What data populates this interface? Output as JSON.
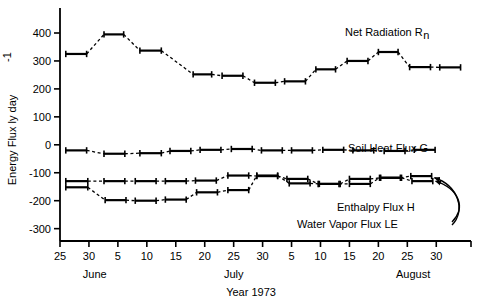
{
  "chart_data": {
    "type": "line",
    "title": "",
    "xlabel": "Year 1973",
    "ylabel": "Energy Flux   ly  day",
    "ylabel_exponent": "-1",
    "ylim": [
      -300,
      450
    ],
    "yticks": [
      400,
      300,
      200,
      100,
      0,
      -100,
      -200,
      -300
    ],
    "ytick_labels": [
      "400",
      "300",
      "200",
      "100",
      "0",
      "-100",
      "-200",
      "-300"
    ],
    "xlim_day": [
      25,
      96
    ],
    "xticks_day": [
      25,
      30,
      35,
      40,
      45,
      50,
      55,
      60,
      65,
      70,
      75,
      80,
      85,
      90,
      96
    ],
    "xtick_labels": [
      "25",
      "30",
      "5",
      "10",
      "15",
      "20",
      "25",
      "30",
      "5",
      "10",
      "15",
      "20",
      "25",
      "30",
      ""
    ],
    "month_labels": [
      {
        "text": "June",
        "day": 31
      },
      {
        "text": "July",
        "day": 55
      },
      {
        "text": "August",
        "day": 86
      }
    ],
    "grid": false,
    "legend": "inline-annotations",
    "marker_style": "horizontal-period-bar-with-end-serifs",
    "connector_style": "dashed",
    "series": [
      {
        "name": "Net Radiation",
        "symbol": "Rn",
        "label": "Net Radiation  R",
        "label_sub": "n",
        "label_x": 345,
        "label_y": 36,
        "bars": [
          {
            "start": 26.0,
            "end": 29.6,
            "value": 325
          },
          {
            "start": 32.6,
            "end": 36.0,
            "value": 395
          },
          {
            "start": 38.8,
            "end": 42.5,
            "value": 337
          },
          {
            "start": 48.0,
            "end": 51.2,
            "value": 252
          },
          {
            "start": 53.0,
            "end": 56.6,
            "value": 247
          },
          {
            "start": 58.6,
            "end": 62.2,
            "value": 222
          },
          {
            "start": 63.8,
            "end": 67.4,
            "value": 227
          },
          {
            "start": 69.2,
            "end": 72.6,
            "value": 270
          },
          {
            "start": 74.6,
            "end": 78.2,
            "value": 300
          },
          {
            "start": 80.0,
            "end": 83.4,
            "value": 332
          },
          {
            "start": 85.4,
            "end": 89.0,
            "value": 278
          },
          {
            "start": 90.6,
            "end": 94.2,
            "value": 277
          }
        ]
      },
      {
        "name": "Soil Heat Flux",
        "symbol": "G",
        "label": "Soil Heat Flux  G",
        "label_sub": "",
        "label_x": 348,
        "label_y": 152,
        "bars": [
          {
            "start": 26.0,
            "end": 29.6,
            "value": -20
          },
          {
            "start": 32.6,
            "end": 36.2,
            "value": -32
          },
          {
            "start": 38.8,
            "end": 42.5,
            "value": -30
          },
          {
            "start": 44.0,
            "end": 47.6,
            "value": -22
          },
          {
            "start": 49.2,
            "end": 52.8,
            "value": -18
          },
          {
            "start": 54.6,
            "end": 58.2,
            "value": -15
          },
          {
            "start": 59.8,
            "end": 63.4,
            "value": -20
          },
          {
            "start": 65.0,
            "end": 68.6,
            "value": -20
          },
          {
            "start": 70.4,
            "end": 74.0,
            "value": -18
          },
          {
            "start": 75.6,
            "end": 79.2,
            "value": -20
          },
          {
            "start": 81.0,
            "end": 84.6,
            "value": -22
          },
          {
            "start": 86.2,
            "end": 89.8,
            "value": -18
          }
        ]
      },
      {
        "name": "Enthalpy Flux",
        "symbol": "H",
        "label": "Enthalpy  Flux   H",
        "label_sub": "",
        "label_x": 337,
        "label_y": 211,
        "bars": [
          {
            "start": 26.0,
            "end": 29.8,
            "value": -130
          },
          {
            "start": 32.6,
            "end": 36.2,
            "value": -130
          },
          {
            "start": 38.0,
            "end": 41.6,
            "value": -130
          },
          {
            "start": 43.2,
            "end": 46.8,
            "value": -130
          },
          {
            "start": 48.4,
            "end": 52.0,
            "value": -128
          },
          {
            "start": 54.0,
            "end": 57.6,
            "value": -110
          },
          {
            "start": 59.0,
            "end": 62.6,
            "value": -112
          },
          {
            "start": 64.2,
            "end": 67.8,
            "value": -122
          },
          {
            "start": 69.6,
            "end": 73.2,
            "value": -140
          },
          {
            "start": 75.0,
            "end": 78.6,
            "value": -140
          },
          {
            "start": 80.2,
            "end": 83.8,
            "value": -118
          },
          {
            "start": 85.6,
            "end": 89.2,
            "value": -112
          }
        ]
      },
      {
        "name": "Water Vapor Flux",
        "symbol": "LE",
        "label": "Water  Vapor  Flux   LE",
        "label_sub": "",
        "label_x": 297,
        "label_y": 228,
        "bars": [
          {
            "start": 26.0,
            "end": 29.8,
            "value": -152
          },
          {
            "start": 32.8,
            "end": 36.4,
            "value": -198
          },
          {
            "start": 38.0,
            "end": 41.6,
            "value": -200
          },
          {
            "start": 43.2,
            "end": 46.8,
            "value": -196
          },
          {
            "start": 48.6,
            "end": 52.2,
            "value": -170
          },
          {
            "start": 54.0,
            "end": 57.6,
            "value": -162
          },
          {
            "start": 59.0,
            "end": 62.6,
            "value": -110
          },
          {
            "start": 64.6,
            "end": 68.2,
            "value": -138
          },
          {
            "start": 69.8,
            "end": 73.4,
            "value": -140
          },
          {
            "start": 75.0,
            "end": 78.6,
            "value": -122
          },
          {
            "start": 80.4,
            "end": 84.0,
            "value": -118
          },
          {
            "start": 85.8,
            "end": 89.4,
            "value": -130
          }
        ]
      }
    ],
    "leader_arrows": [
      {
        "from_series": "Enthalpy Flux",
        "to_day": 89.0,
        "to_value": -118
      },
      {
        "from_series": "Water Vapor Flux",
        "to_day": 89.2,
        "to_value": -130
      }
    ]
  }
}
